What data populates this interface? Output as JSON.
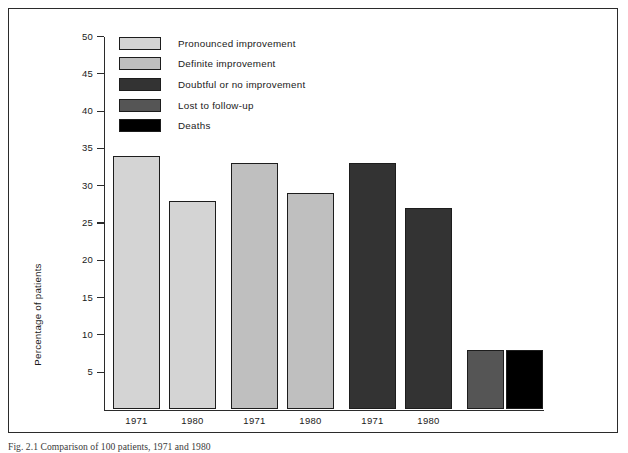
{
  "figure": {
    "caption": "Fig. 2.1 Comparison of 100 patients, 1971 and 1980"
  },
  "chart_data": {
    "type": "bar",
    "title": "",
    "xlabel": "",
    "ylabel": "Percentage of patients",
    "ylim": [
      0,
      50
    ],
    "yticks": [
      5,
      10,
      15,
      20,
      25,
      30,
      35,
      40,
      45,
      50
    ],
    "grid": false,
    "legend_position": "upper-left-inside",
    "categories": [
      "1971",
      "1980",
      "1971",
      "1980",
      "1971",
      "1980",
      "",
      ""
    ],
    "groups": [
      {
        "name": "Pronounced improvement",
        "color": "#d4d4d4",
        "bars": [
          {
            "x_label": "1971",
            "value": 34
          },
          {
            "x_label": "1980",
            "value": 28
          }
        ]
      },
      {
        "name": "Definite improvement",
        "color": "#bfbfbf",
        "bars": [
          {
            "x_label": "1971",
            "value": 33
          },
          {
            "x_label": "1980",
            "value": 29
          }
        ]
      },
      {
        "name": "Doubtful or no improvement",
        "color": "#333333",
        "bars": [
          {
            "x_label": "1971",
            "value": 33
          },
          {
            "x_label": "1980",
            "value": 27
          }
        ]
      },
      {
        "name": "Lost to follow-up",
        "color": "#555555",
        "bars": [
          {
            "x_label": "",
            "value": 8
          }
        ]
      },
      {
        "name": "Deaths",
        "color": "#000000",
        "bars": [
          {
            "x_label": "",
            "value": 8
          }
        ]
      }
    ],
    "values": [
      34,
      28,
      33,
      29,
      33,
      27,
      8,
      8
    ],
    "legend": [
      {
        "label": "Pronounced improvement",
        "color": "#d4d4d4"
      },
      {
        "label": "Definite improvement",
        "color": "#bfbfbf"
      },
      {
        "label": "Doubtful or no improvement",
        "color": "#333333"
      },
      {
        "label": "Lost to follow-up",
        "color": "#555555"
      },
      {
        "label": "Deaths",
        "color": "#000000"
      }
    ]
  },
  "axis": {
    "y_title": "Percentage of patients",
    "y_labels": [
      "50",
      "45",
      "40",
      "35",
      "30",
      "25",
      "20",
      "15",
      "10",
      "5"
    ],
    "x_labels": [
      "1971",
      "1980",
      "1971",
      "1980",
      "1971",
      "1980"
    ]
  }
}
